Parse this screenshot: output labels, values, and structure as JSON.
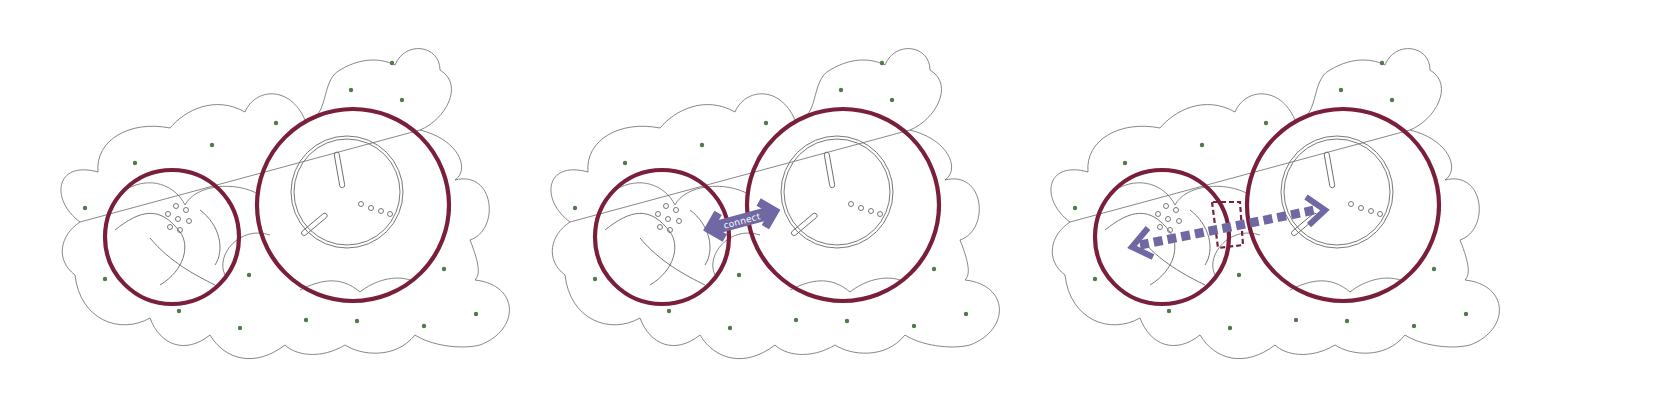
{
  "figure": {
    "type": "architectural concept diagram sequence",
    "panel_count": 3
  },
  "colors": {
    "background": "#ffffff",
    "outline": "#6a6a6a",
    "ring": "#7a1f3a",
    "tree_dot": "#4f7a4a",
    "arrow": "#6f68a3",
    "arrow_label_text": "#ffffff"
  },
  "panels": [
    {
      "id": "panel-1",
      "state": "separate",
      "offset_x": 0,
      "has_arrow": false,
      "has_bridge": false
    },
    {
      "id": "panel-2",
      "state": "connect",
      "offset_x": 520,
      "has_arrow": true,
      "arrow_style": "solid-double-headed",
      "arrow_label": "connect",
      "has_bridge": false
    },
    {
      "id": "panel-3",
      "state": "linked",
      "offset_x": 1040,
      "has_arrow": true,
      "arrow_style": "dashed-double-headed",
      "has_bridge": true,
      "bridge_style": "dashed"
    }
  ],
  "elements": {
    "small_ring": {
      "cx": 175,
      "cy": 235,
      "r": 68
    },
    "large_ring": {
      "cx": 358,
      "cy": 196,
      "r": 97
    },
    "inner_drum": {
      "cx": 347,
      "cy": 192,
      "r_outer": 56,
      "r_inner": 53
    },
    "tree_dot_count": 17
  }
}
